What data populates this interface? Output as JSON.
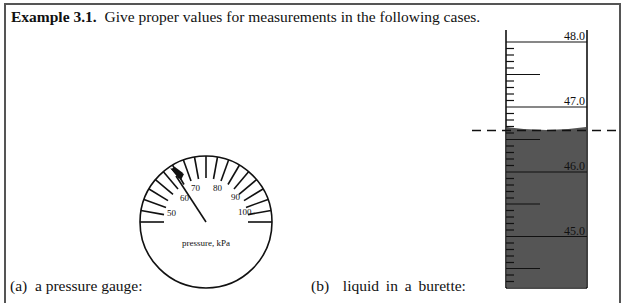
{
  "example": {
    "label": "Example 3.1.",
    "prompt": "Give proper values for measurements in the following cases."
  },
  "cases": [
    {
      "id": "a",
      "marker": "(a)",
      "text": "a pressure gauge:"
    },
    {
      "id": "b",
      "marker": "(b)",
      "text": "liquid in a burette:"
    }
  ],
  "gauge": {
    "unit_label": "pressure, kPa",
    "scale_labels": [
      "50",
      "60",
      "70",
      "80",
      "90",
      "100"
    ],
    "needle_reading_approx": "≈62"
  },
  "burette": {
    "scale_labels": [
      "48.0",
      "47.0",
      "46.0",
      "45.0"
    ],
    "meniscus_reading_approx": "≈46.65",
    "liquid_color": "#555555"
  }
}
